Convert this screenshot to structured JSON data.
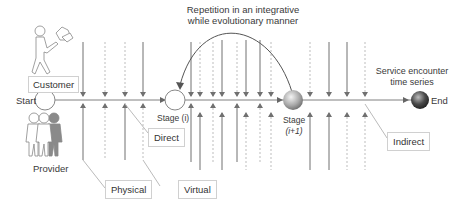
{
  "diagram": {
    "title_annotation": {
      "line1": "Repetition in an integrative",
      "line2": "while evolutionary manner"
    },
    "actors": {
      "customer": "Customer",
      "provider": "Provider"
    },
    "timeline": {
      "start": "Start",
      "end": "End",
      "stage_i": "Stage (i)",
      "stage_i1_line1": "Stage",
      "stage_i1_line2": "(i+1)",
      "series_label_line1": "Service encounter",
      "series_label_line2": "time series"
    },
    "legend": {
      "physical": "Physical",
      "virtual": "Virtual",
      "direct": "Direct",
      "indirect": "Indirect"
    },
    "colors": {
      "line": "#707070",
      "dotted": "#bdbdbd",
      "box_border": "#d0d0d0",
      "text": "#333333"
    }
  }
}
